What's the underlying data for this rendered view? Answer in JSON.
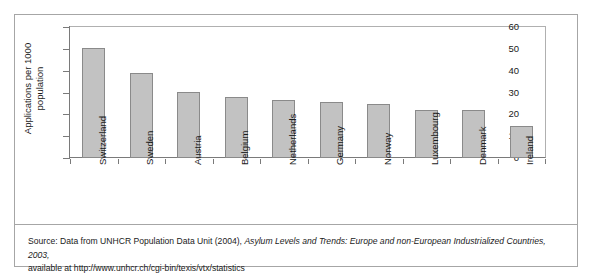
{
  "figure": {
    "caption_prefix": "Source:  Data from UNHCR Population Data Unit (2004), ",
    "caption_title": "Asylum Levels and Trends: Europe and non-European Industrialized Countries, 2003,",
    "caption_line2": "available at http://www.unhcr.ch/cgi-bin/texis/vtx/statistics"
  },
  "axis": {
    "y_title": "Applications per 1000\npopulation",
    "ticks": [
      "60",
      "50",
      "40",
      "30",
      "20",
      "10",
      "0"
    ]
  },
  "colors": {
    "bar_fill": "#c2c2c2",
    "bar_border": "#8a8a8a",
    "frame": "#a6a6a6",
    "text": "#1a1a1a"
  },
  "chart_data": {
    "type": "bar",
    "title": "",
    "xlabel": "",
    "ylabel": "Applications per 1000 population",
    "ylim": [
      0,
      60
    ],
    "ytick_step": 10,
    "grid": false,
    "legend": "none",
    "categories": [
      "Switzerland",
      "Sweden",
      "Austria",
      "Belgium",
      "Netherlands",
      "Germany",
      "Norway",
      "Luxembourg",
      "Denmark",
      "Ireland"
    ],
    "values": [
      50.5,
      38.8,
      30.4,
      27.8,
      26.4,
      25.8,
      24.8,
      22.2,
      22.1,
      14.5
    ]
  }
}
